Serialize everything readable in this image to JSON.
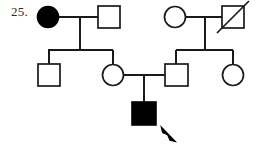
{
  "figure": {
    "label": "25.",
    "type": "pedigree-chart",
    "stroke_color": "#1a1a1a",
    "fill_affected_color": "#000000",
    "fill_unaffected_color": "#ffffff",
    "background_color": "#ffffff",
    "generations": 3,
    "legend_implied": {
      "filled_shape": "affected individual",
      "open_shape": "unaffected individual",
      "square": "male",
      "circle": "female",
      "slashed_shape": "deceased individual",
      "arrow": "proband"
    }
  },
  "individuals": [
    {
      "id": "I-1",
      "shape": "circle",
      "sex": "female",
      "affected": true,
      "deceased": false,
      "generation": 1,
      "cx": 48,
      "cy": 17,
      "r": 10.5
    },
    {
      "id": "I-2",
      "shape": "square",
      "sex": "male",
      "affected": false,
      "deceased": false,
      "generation": 1,
      "x": 98,
      "y": 6,
      "size": 22
    },
    {
      "id": "I-3",
      "shape": "circle",
      "sex": "female",
      "affected": false,
      "deceased": false,
      "generation": 1,
      "cx": 175,
      "cy": 17,
      "r": 10.5
    },
    {
      "id": "I-4",
      "shape": "square",
      "sex": "male",
      "affected": false,
      "deceased": true,
      "generation": 1,
      "x": 222,
      "y": 6,
      "size": 22
    },
    {
      "id": "II-1",
      "shape": "square",
      "sex": "male",
      "affected": false,
      "deceased": false,
      "generation": 2,
      "x": 38,
      "y": 64,
      "size": 22
    },
    {
      "id": "II-2",
      "shape": "circle",
      "sex": "female",
      "affected": false,
      "deceased": false,
      "generation": 2,
      "cx": 113,
      "cy": 75,
      "r": 10.5
    },
    {
      "id": "II-3",
      "shape": "square",
      "sex": "male",
      "affected": false,
      "deceased": false,
      "generation": 2,
      "x": 165,
      "y": 64,
      "size": 22
    },
    {
      "id": "II-4",
      "shape": "circle",
      "sex": "female",
      "affected": false,
      "deceased": false,
      "generation": 2,
      "cx": 233,
      "cy": 75,
      "r": 10.5
    },
    {
      "id": "III-1",
      "shape": "square",
      "sex": "male",
      "affected": true,
      "deceased": false,
      "proband": true,
      "generation": 3,
      "x": 132,
      "y": 102,
      "size": 23
    }
  ],
  "matings": [
    {
      "id": "mating-I-1-I-2",
      "partners": [
        "I-1",
        "I-2"
      ],
      "line_y": 17,
      "line_x1": 58,
      "line_x2": 98,
      "drop_x": 80,
      "drop_y2": 50,
      "children": [
        "II-1",
        "II-2"
      ]
    },
    {
      "id": "mating-I-3-I-4",
      "partners": [
        "I-3",
        "I-4"
      ],
      "line_y": 17,
      "line_x1": 186,
      "line_x2": 222,
      "drop_x": 205,
      "drop_y2": 50,
      "children": [
        "II-3",
        "II-4"
      ]
    },
    {
      "id": "mating-II-2-II-3",
      "partners": [
        "II-2",
        "II-3"
      ],
      "line_y": 75,
      "line_x1": 124,
      "line_x2": 165,
      "drop_x": 144,
      "drop_y2": 102,
      "children": [
        "III-1"
      ]
    }
  ],
  "sibships": [
    {
      "id": "sibship-left",
      "bar_y": 50,
      "bar_x1": 49,
      "bar_x2": 113,
      "stub_y2": 64,
      "members": [
        "II-1",
        "II-2"
      ]
    },
    {
      "id": "sibship-right",
      "bar_y": 50,
      "bar_x1": 176,
      "bar_x2": 233,
      "stub_y2": 64,
      "members": [
        "II-3",
        "II-4"
      ]
    }
  ],
  "proband_arrow": {
    "id": "proband-arrow",
    "points_to": "III-1",
    "tip_x": 161,
    "tip_y": 127,
    "tail_x": 175,
    "tail_y": 142
  }
}
